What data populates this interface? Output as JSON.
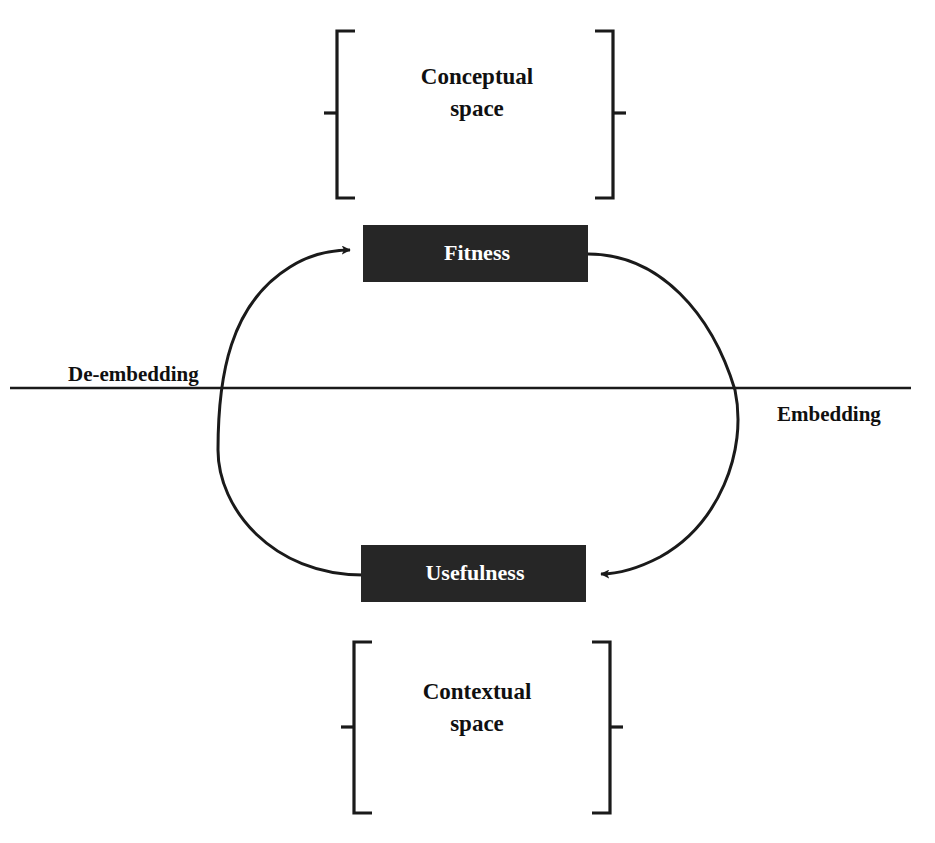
{
  "diagram": {
    "background_color": "#ffffff",
    "line_color": "#1a1a1a",
    "node_fill_color": "#262626",
    "node_text_color": "#ffffff",
    "nodes": [
      {
        "id": "fitness",
        "label": "Fitness"
      },
      {
        "id": "usefulness",
        "label": "Usefulness"
      }
    ],
    "brackets": [
      {
        "id": "conceptual",
        "label_line1": "Conceptual",
        "label_line2": "space"
      },
      {
        "id": "contextual",
        "label_line1": "Contextual",
        "label_line2": "space"
      }
    ],
    "axis": {
      "left_label": "De-embedding",
      "right_label": "Embedding"
    },
    "arrows": [
      {
        "id": "to-fitness",
        "from": "usefulness",
        "to": "fitness",
        "side": "left",
        "direction": "upward"
      },
      {
        "id": "to-usefulness",
        "from": "fitness",
        "to": "usefulness",
        "side": "right",
        "direction": "downward"
      }
    ]
  }
}
